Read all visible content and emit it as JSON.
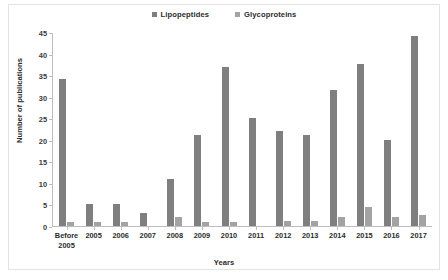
{
  "chart_data": {
    "type": "bar",
    "title": "",
    "xlabel": "Years",
    "ylabel": "Number of publications",
    "categories": [
      "Before\n2005",
      "2005",
      "2006",
      "2007",
      "2008",
      "2009",
      "2010",
      "2011",
      "2012",
      "2013",
      "2014",
      "2015",
      "2016",
      "2017"
    ],
    "series": [
      {
        "name": "Lipopeptides",
        "color": "#7f7f7f",
        "values": [
          34,
          5,
          5,
          3,
          11,
          21,
          37,
          25,
          22,
          21,
          31.5,
          37.5,
          20,
          44
        ]
      },
      {
        "name": "Glycoproteins",
        "color": "#a3a3a3",
        "values": [
          1,
          1,
          1,
          0,
          2,
          1,
          1,
          0,
          1.2,
          1.2,
          2.2,
          4.5,
          2.2,
          2.5
        ]
      }
    ],
    "ylim": [
      0,
      45
    ],
    "yticks": [
      0,
      5,
      10,
      15,
      20,
      25,
      30,
      35,
      40,
      45
    ],
    "ytick_labels": [
      "0",
      "5",
      "10",
      "15",
      "20",
      "25",
      "30",
      "35",
      "40",
      "45"
    ],
    "grid": false,
    "legend_position": "top-center"
  },
  "legend": [
    {
      "label": "Lipopeptides",
      "color": "#7f7f7f"
    },
    {
      "label": "Glycoproteins",
      "color": "#a3a3a3"
    }
  ]
}
